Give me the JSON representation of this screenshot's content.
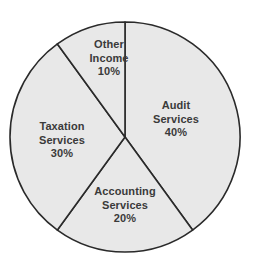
{
  "chart_data": {
    "type": "pie",
    "title": "",
    "subtitle": "",
    "xlabel": "",
    "ylabel": "",
    "legend": "none",
    "grid": false,
    "units": "percent",
    "total": 100,
    "start_angle_deg": 0,
    "direction": "clockwise",
    "categories": [
      "Audit Services",
      "Accounting Services",
      "Taxation Services",
      "Other Income"
    ],
    "values": [
      40,
      20,
      30,
      10
    ],
    "labels_inside": true,
    "slices": [
      {
        "name": "Audit Services",
        "value": 40,
        "value_label": "40%",
        "name_lines": [
          "Audit",
          "Services"
        ],
        "start_deg": 0,
        "end_deg": 144,
        "fill": "#e8e8e8",
        "stroke": "#2a2a2a",
        "label_x": 176,
        "label_y": 119
      },
      {
        "name": "Accounting Services",
        "value": 20,
        "value_label": "20%",
        "name_lines": [
          "Accounting",
          "Services"
        ],
        "start_deg": 144,
        "end_deg": 216,
        "fill": "#e8e8e8",
        "stroke": "#2a2a2a",
        "label_x": 125,
        "label_y": 205
      },
      {
        "name": "Taxation Services",
        "value": 30,
        "value_label": "30%",
        "name_lines": [
          "Taxation",
          "Services"
        ],
        "start_deg": 216,
        "end_deg": 324,
        "fill": "#e8e8e8",
        "stroke": "#2a2a2a",
        "label_x": 62,
        "label_y": 140
      },
      {
        "name": "Other Income",
        "value": 10,
        "value_label": "10%",
        "name_lines": [
          "Other",
          "Income"
        ],
        "start_deg": 324,
        "end_deg": 360,
        "fill": "#e8e8e8",
        "stroke": "#2a2a2a",
        "label_x": 109,
        "label_y": 58
      }
    ],
    "geometry": {
      "center_x": 125,
      "center_y": 137,
      "radius": 115,
      "stroke_width": 1.6
    },
    "colors": {
      "background": "#ffffff",
      "slice_fill": "#e8e8e8",
      "slice_stroke": "#2a2a2a",
      "label_text": "#3a3a3a"
    }
  }
}
